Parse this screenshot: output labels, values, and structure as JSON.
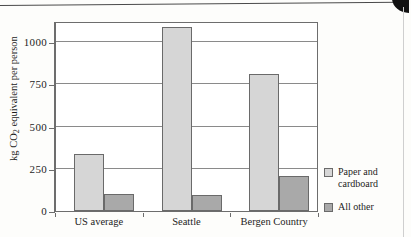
{
  "page": {
    "cut_heading_fragment": "",
    "corner_artifact": "page-corner-mark"
  },
  "chart_data": {
    "type": "bar",
    "title": "",
    "xlabel": "",
    "ylabel": "kg CO2 equivalent per person",
    "ylabel_prefix": "kg CO",
    "ylabel_sub": "2",
    "ylabel_suffix": " equivalent per person",
    "categories": [
      "US average",
      "Seattle",
      "Bergen Country"
    ],
    "series": [
      {
        "name": "Paper and cardboard",
        "color": "#d6d6d6",
        "values": [
          340,
          1090,
          810
        ]
      },
      {
        "name": "All other",
        "color": "#a9a9a9",
        "values": [
          100,
          95,
          210
        ]
      }
    ],
    "ylim": [
      0,
      1125
    ],
    "yticks": [
      0,
      250,
      500,
      750,
      1000
    ],
    "ytick_labels": [
      "0",
      "250",
      "500",
      "750",
      "1000"
    ],
    "grid": true,
    "legend_position": "right",
    "legend": [
      {
        "label_line1": "Paper and",
        "label_line2": "cardboard",
        "swatch": "#d6d6d6"
      },
      {
        "label_line1": "All other",
        "label_line2": "",
        "swatch": "#a9a9a9"
      }
    ]
  }
}
